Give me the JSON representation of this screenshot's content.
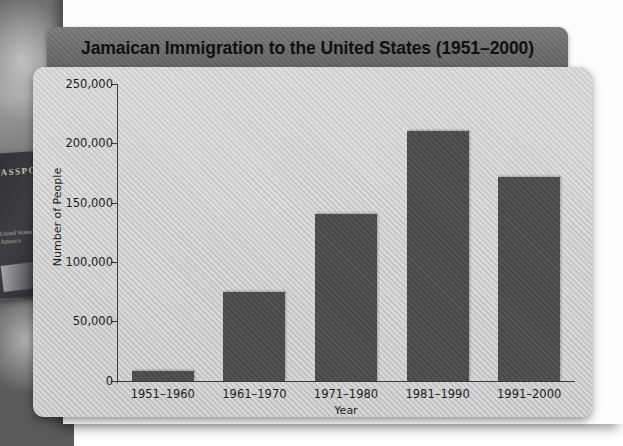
{
  "background": {
    "photo_alt": "passport-and-travel-documents-photo",
    "passport_cover_text": "PASSPORT",
    "passport_sub_text": "United States of America"
  },
  "chart_data": {
    "type": "bar",
    "title": "Jamaican Immigration to the United States (1951–2000)",
    "xlabel": "Year",
    "ylabel": "Number of People",
    "categories": [
      "1951–1960",
      "1961–1970",
      "1971–1980",
      "1981–1990",
      "1991–2000"
    ],
    "values": [
      8000,
      75000,
      140000,
      210000,
      172000
    ],
    "ylim": [
      0,
      250000
    ],
    "ytick_values": [
      0,
      50000,
      100000,
      150000,
      200000,
      250000
    ],
    "ytick_labels": [
      "0",
      "50,000",
      "100,000",
      "150,000",
      "200,000",
      "250,000"
    ],
    "grid": false,
    "legend": false,
    "bar_color": "#4b4b4b",
    "plot_background": "#cccccc",
    "title_bar_color": "#6c6c6c",
    "axis_color": "#3a3a3a"
  }
}
